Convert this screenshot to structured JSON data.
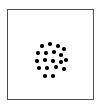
{
  "figure": {
    "kind": "dot-array-stimulus",
    "background_color": "#ffffff",
    "frame": {
      "border_color": "#4d4d4d",
      "border_width_px": 1,
      "x_px": 7,
      "y_px": 9,
      "width_px": 87,
      "height_px": 91
    },
    "dots": {
      "count": 19,
      "color": "#000000",
      "diameter_px": 3.4,
      "shape": "circle",
      "arrangement": "irregular-circular-cluster"
    }
  },
  "chart_data": {
    "type": "scatter",
    "title": "",
    "subtitle": "",
    "xlabel": "",
    "ylabel": "",
    "grid": false,
    "legend_position": "none",
    "axes_visible": false,
    "marker": {
      "shape": "circle",
      "color": "#000000",
      "size_px": 3.4
    },
    "xlim": [
      0,
      87
    ],
    "ylim": [
      0,
      91
    ],
    "point_count": 19,
    "points": [
      {
        "x": 34,
        "y": 36
      },
      {
        "x": 42,
        "y": 34
      },
      {
        "x": 50,
        "y": 36
      },
      {
        "x": 56,
        "y": 39
      },
      {
        "x": 30,
        "y": 43
      },
      {
        "x": 38,
        "y": 43
      },
      {
        "x": 46,
        "y": 42
      },
      {
        "x": 53,
        "y": 45
      },
      {
        "x": 29,
        "y": 51
      },
      {
        "x": 37,
        "y": 50
      },
      {
        "x": 45,
        "y": 51
      },
      {
        "x": 53,
        "y": 52
      },
      {
        "x": 58,
        "y": 50
      },
      {
        "x": 31,
        "y": 58
      },
      {
        "x": 39,
        "y": 58
      },
      {
        "x": 48,
        "y": 57
      },
      {
        "x": 56,
        "y": 59
      },
      {
        "x": 37,
        "y": 66
      },
      {
        "x": 45,
        "y": 66
      }
    ]
  }
}
